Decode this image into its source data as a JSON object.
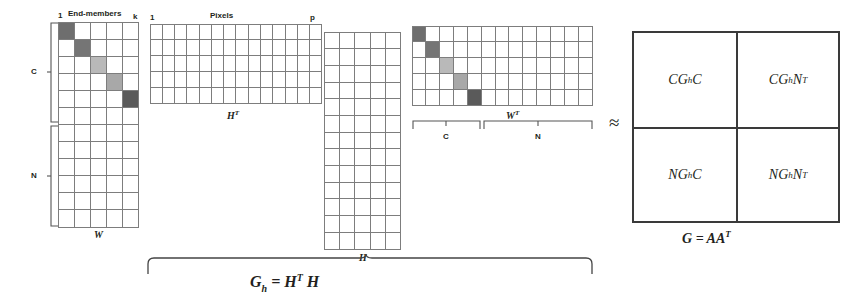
{
  "figure": {
    "approx_symbol": "≈"
  },
  "matrix_A": {
    "name": "A",
    "top_label": "End-members",
    "top_left_index": "1",
    "top_right_index": "k",
    "bottom_label": "W",
    "left_bracket_labels": [
      "C",
      "N"
    ],
    "columns": 5,
    "rows": 12,
    "c_rows": 5,
    "n_rows": 7,
    "diagonal_shades": [
      "#6e6e6e",
      "#757575",
      "#b9b9b9",
      "#a8a8a8",
      "#5a5a5a"
    ]
  },
  "matrix_HT": {
    "name": "H^T",
    "top_label": "Pixels",
    "top_left_index": "1",
    "top_right_index": "p",
    "bottom_label": "H",
    "bottom_label_sup": "T",
    "columns": 14,
    "rows": 5
  },
  "matrix_H": {
    "name": "H",
    "bottom_label": "H",
    "columns": 5,
    "rows": 13
  },
  "matrix_WT": {
    "name": "W^T",
    "bottom_label": "W",
    "bottom_label_sup": "T",
    "bracket_labels": [
      "C",
      "N"
    ],
    "columns": 13,
    "rows": 5,
    "c_columns": 5,
    "n_columns": 8,
    "diagonal_shades": [
      "#6e6e6e",
      "#757575",
      "#b9b9b9",
      "#a8a8a8",
      "#5a5a5a"
    ]
  },
  "brace_caption": {
    "lhs": "G",
    "lhs_sub": "h",
    "eq": " = H",
    "sup": "T",
    "rhs": " H"
  },
  "block_matrix": {
    "caption_lhs": "G",
    "caption_eq": " = AA",
    "caption_sup": "T",
    "cells": [
      {
        "prefix": "C",
        "g": "G",
        "sub": "h",
        "suffix": "C",
        "sup": ""
      },
      {
        "prefix": "C",
        "g": "G",
        "sub": "h",
        "suffix": "N",
        "sup": "T"
      },
      {
        "prefix": "N",
        "g": "G",
        "sub": "h",
        "suffix": "C",
        "sup": ""
      },
      {
        "prefix": "N",
        "g": "G",
        "sub": "h",
        "suffix": "N",
        "sup": "T"
      }
    ]
  },
  "colors": {
    "grid_line": "#7d7d7d",
    "block_border": "#3a3a3a",
    "text": "#231f20",
    "background": "#ffffff"
  }
}
